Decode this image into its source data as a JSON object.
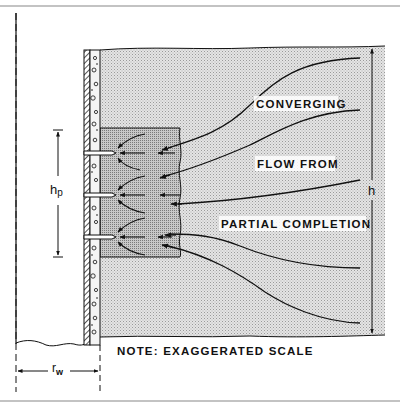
{
  "diagram": {
    "type": "partial-completion-converging-flow",
    "labels": {
      "line1": "CONVERGING",
      "line2": "FLOW FROM",
      "line3": "PARTIAL COMPLETION",
      "note": "NOTE: EXAGGERATED SCALE"
    },
    "dimensions": {
      "perforated_interval": "h",
      "perforated_interval_sub": "p",
      "formation_thickness": "h",
      "wellbore_radius": "r",
      "wellbore_radius_sub": "w"
    },
    "elements": [
      "wellbore",
      "casing",
      "cement",
      "formation",
      "perforations",
      "flow-lines"
    ],
    "perforation_count": 3,
    "colors": {
      "ink": "#111111",
      "formation_fill": "#d9d9d9",
      "border": "#888888"
    }
  }
}
